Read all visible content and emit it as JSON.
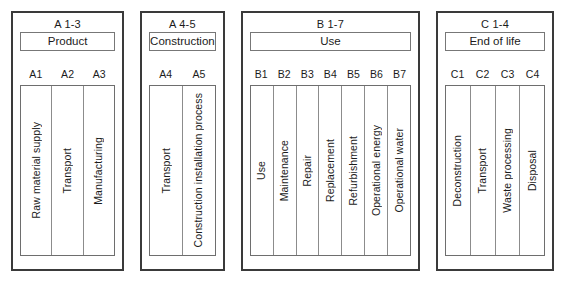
{
  "diagram": {
    "stages": [
      {
        "code": "A 1-3",
        "title": "Product",
        "key": "product",
        "modules": [
          {
            "code": "A1",
            "label": "Raw material supply"
          },
          {
            "code": "A2",
            "label": "Transport"
          },
          {
            "code": "A3",
            "label": "Manufacturing"
          }
        ]
      },
      {
        "code": "A 4-5",
        "title": "Construction",
        "key": "construction",
        "modules": [
          {
            "code": "A4",
            "label": "Transport"
          },
          {
            "code": "A5",
            "label": "Construction installation process"
          }
        ]
      },
      {
        "code": "B 1-7",
        "title": "Use",
        "key": "use",
        "modules": [
          {
            "code": "B1",
            "label": "Use"
          },
          {
            "code": "B2",
            "label": "Maintenance"
          },
          {
            "code": "B3",
            "label": "Repair"
          },
          {
            "code": "B4",
            "label": "Replacement"
          },
          {
            "code": "B5",
            "label": "Refurbishment"
          },
          {
            "code": "B6",
            "label": "Operational energy"
          },
          {
            "code": "B7",
            "label": "Operational water"
          }
        ]
      },
      {
        "code": "C 1-4",
        "title": "End of life",
        "key": "endoflife",
        "modules": [
          {
            "code": "C1",
            "label": "Deconstruction"
          },
          {
            "code": "C2",
            "label": "Transport"
          },
          {
            "code": "C3",
            "label": "Waste processing"
          },
          {
            "code": "C4",
            "label": "Disposal"
          }
        ]
      }
    ],
    "colors": {
      "background": "#ffffff",
      "stage_border": "#3a3a3a",
      "title_border": "#777777",
      "module_border": "#8c8c8c",
      "text": "#1b1b1b"
    }
  }
}
